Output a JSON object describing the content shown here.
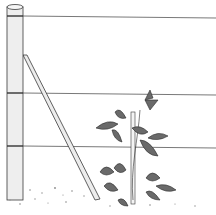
{
  "illustration": {
    "subject": "fence post with trellis wires and a young climbing plant tied to a stake",
    "colors": {
      "ink": "#3a3a3a",
      "paper": "#ffffff",
      "shade": "#9a9a9a"
    },
    "wires": [
      16,
      93,
      146
    ],
    "post": {
      "x": 7,
      "width": 16,
      "top": 6,
      "bottom": 200,
      "bands": [
        16,
        93,
        146
      ]
    },
    "brace": {
      "from": [
        23,
        55
      ],
      "to": [
        97,
        200
      ]
    }
  }
}
